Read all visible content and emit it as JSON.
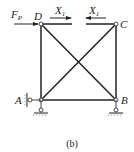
{
  "figure": {
    "caption": "(b)",
    "nodes": {
      "A": {
        "label": "A"
      },
      "B": {
        "label": "B"
      },
      "C": {
        "label": "C"
      },
      "D": {
        "label": "D"
      }
    },
    "loads": {
      "fp": {
        "label": "F",
        "sub": "P"
      },
      "x1_left": {
        "label": "X",
        "sub": "1"
      },
      "x1_right": {
        "label": "X",
        "sub": "1"
      }
    },
    "colors": {
      "line": "#222222",
      "hatch": "#888888"
    }
  }
}
